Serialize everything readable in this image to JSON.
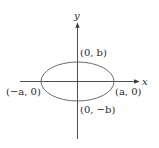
{
  "diagram": {
    "axes": {
      "x_label": "x",
      "y_label": "y"
    },
    "points": {
      "top": "(0, b)",
      "bottom": "(0, −b)",
      "left": "(−a, 0)",
      "right": "(a, 0)"
    },
    "colors": {
      "ellipse": "#6b6b6b",
      "axes": "#3a3a3a",
      "text": "#2a2a2a",
      "background": "#ffffff"
    }
  }
}
